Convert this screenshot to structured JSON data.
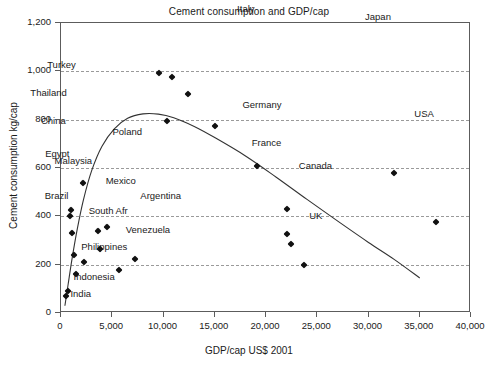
{
  "chart_data": {
    "type": "scatter",
    "title": "Cement consumption and GDP/cap",
    "xlabel": "GDP/cap US$ 2001",
    "ylabel": "Cement consumption kg/cap",
    "xlim": [
      0,
      40000
    ],
    "ylim": [
      0,
      1200
    ],
    "xticks": [
      "0",
      "5,000",
      "10,000",
      "15,000",
      "20,000",
      "25,000",
      "30,000",
      "35,000",
      "40,000"
    ],
    "xtick_values": [
      0,
      5000,
      10000,
      15000,
      20000,
      25000,
      30000,
      35000,
      40000
    ],
    "yticks": [
      "0",
      "200",
      "400",
      "600",
      "800",
      "1,000",
      "1,200"
    ],
    "ytick_values": [
      0,
      200,
      400,
      600,
      800,
      1000,
      1200
    ],
    "gridlines_y": [
      200,
      400,
      600,
      800,
      1000
    ],
    "grid": "horizontal-dashed",
    "legend": "none",
    "marker_shape": "diamond",
    "marker_color": "#111111",
    "curve_color": "#333333",
    "points": [
      {
        "label": "India",
        "x": 450,
        "y": 70,
        "lx": 470,
        "ly": 10,
        "anchor": "left"
      },
      {
        "label": "Indonesia",
        "x": 700,
        "y": 90,
        "lx": 520,
        "ly": 58,
        "anchor": "left"
      },
      {
        "label": "China",
        "x": 900,
        "y": 400,
        "lx": -420,
        "ly": 395,
        "anchor": "right"
      },
      {
        "label": "Thailand",
        "x": 1000,
        "y": 425,
        "lx": -480,
        "ly": 487,
        "anchor": "right"
      },
      {
        "label": "Egypt",
        "x": 1100,
        "y": 330,
        "lx": -300,
        "ly": 330,
        "anchor": "right"
      },
      {
        "label": "Brazil",
        "x": 1250,
        "y": 240,
        "lx": -500,
        "ly": 243,
        "anchor": "right"
      },
      {
        "label": "Philippines",
        "x": 1500,
        "y": 160,
        "lx": 480,
        "ly": 112,
        "anchor": "left"
      },
      {
        "label": "Turkey",
        "x": 2100,
        "y": 540,
        "lx": -620,
        "ly": 485,
        "anchor": "right"
      },
      {
        "label": "South Afr",
        "x": 2200,
        "y": 210,
        "lx": 500,
        "ly": 212,
        "anchor": "left"
      },
      {
        "label": "Malaysia",
        "x": 3600,
        "y": 340,
        "lx": -520,
        "ly": 290,
        "anchor": "right"
      },
      {
        "label": "Mexico",
        "x": 3800,
        "y": 265,
        "lx": 560,
        "ly": 280,
        "anchor": "left"
      },
      {
        "label": "Poland",
        "x": 4500,
        "y": 355,
        "lx": 520,
        "ly": 392,
        "anchor": "left"
      },
      {
        "label": "Venezuela",
        "x": 5700,
        "y": 180,
        "lx": 620,
        "ly": 165,
        "anchor": "left"
      },
      {
        "label": "Argentina",
        "x": 7200,
        "y": 225,
        "lx": 540,
        "ly": 258,
        "anchor": "left"
      },
      {
        "label": "Korea",
        "x": 9600,
        "y": 995,
        "lx": -1000,
        "ly": 1065,
        "anchor": "right"
      },
      {
        "label": "Greece",
        "x": 10300,
        "y": 793,
        "lx": -260,
        "ly": 735,
        "anchor": "right"
      },
      {
        "label": "Portugal",
        "x": 10800,
        "y": 975,
        "lx": 240,
        "ly": 1062,
        "anchor": "left"
      },
      {
        "label": "Taiwan",
        "x": 12400,
        "y": 905,
        "lx": 240,
        "ly": 955,
        "anchor": "left"
      },
      {
        "label": "Spain",
        "x": 15000,
        "y": 775,
        "lx": 60,
        "ly": 712,
        "anchor": "left"
      },
      {
        "label": "Italy",
        "x": 19100,
        "y": 608,
        "lx": -260,
        "ly": 650,
        "anchor": "right"
      },
      {
        "label": "Germany",
        "x": 22000,
        "y": 430,
        "lx": -500,
        "ly": 430,
        "anchor": "right"
      },
      {
        "label": "France",
        "x": 22000,
        "y": 325,
        "lx": -460,
        "ly": 380,
        "anchor": "right"
      },
      {
        "label": "Canada",
        "x": 22400,
        "y": 285,
        "lx": 800,
        "ly": 322,
        "anchor": "left"
      },
      {
        "label": "UK",
        "x": 23700,
        "y": 200,
        "lx": 520,
        "ly": 203,
        "anchor": "left"
      },
      {
        "label": "Japan",
        "x": 32500,
        "y": 578,
        "lx": -300,
        "ly": 648,
        "anchor": "right"
      },
      {
        "label": "USA",
        "x": 36600,
        "y": 375,
        "lx": -180,
        "ly": 448,
        "anchor": "right"
      }
    ],
    "fit_curve": {
      "description": "inverted-U fitted trend line",
      "points": [
        [
          380,
          30
        ],
        [
          700,
          120
        ],
        [
          1100,
          230
        ],
        [
          1600,
          350
        ],
        [
          2200,
          470
        ],
        [
          3000,
          590
        ],
        [
          4000,
          690
        ],
        [
          5200,
          762
        ],
        [
          6500,
          806
        ],
        [
          8000,
          824
        ],
        [
          9500,
          823
        ],
        [
          11000,
          808
        ],
        [
          13000,
          772
        ],
        [
          15000,
          726
        ],
        [
          18000,
          650
        ],
        [
          21000,
          562
        ],
        [
          24000,
          470
        ],
        [
          27000,
          380
        ],
        [
          30000,
          292
        ],
        [
          32500,
          222
        ],
        [
          35000,
          145
        ]
      ]
    }
  }
}
